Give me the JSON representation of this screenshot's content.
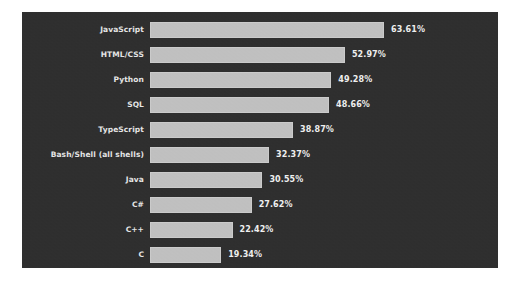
{
  "figure": {
    "background_color": "#ffffff",
    "panel_color": "#2e2e2e",
    "bar_color": "#c2c2c2",
    "label_color": "#e8e8e8",
    "value_color": "#f2f2f2"
  },
  "chart_data": {
    "type": "bar",
    "orientation": "horizontal",
    "title": "",
    "subtitle": "",
    "xlabel": "",
    "ylabel": "",
    "grid": false,
    "legend": "none",
    "xlim": [
      0,
      70
    ],
    "value_suffix": "%",
    "categories": [
      "JavaScript",
      "HTML/CSS",
      "Python",
      "SQL",
      "TypeScript",
      "Bash/Shell (all shells)",
      "Java",
      "C#",
      "C++",
      "C"
    ],
    "values": [
      63.61,
      52.97,
      49.28,
      48.66,
      38.87,
      32.37,
      30.55,
      27.62,
      22.42,
      19.34
    ],
    "value_labels": [
      "63.61%",
      "52.97%",
      "49.28%",
      "48.66%",
      "38.87%",
      "32.37%",
      "30.55%",
      "27.62%",
      "22.42%",
      "19.34%"
    ]
  }
}
